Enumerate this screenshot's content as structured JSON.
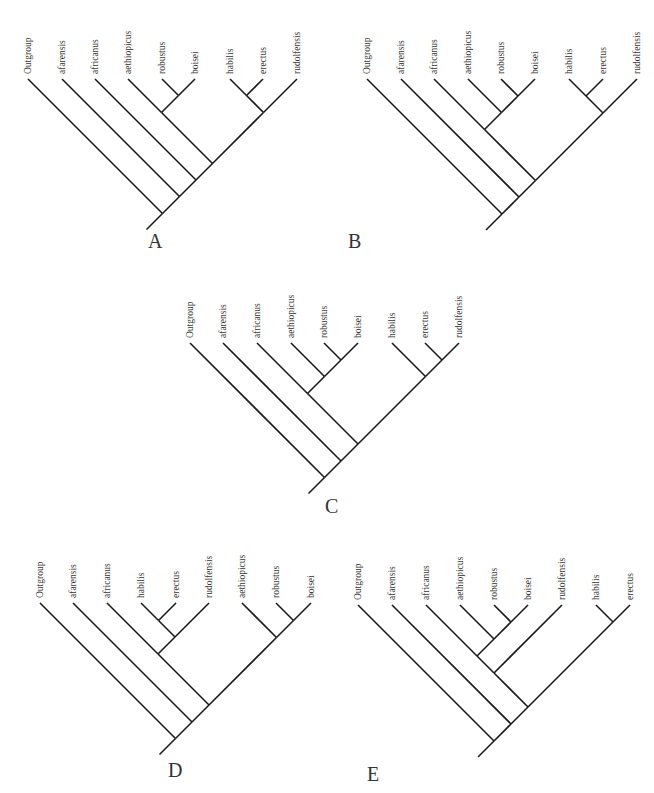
{
  "figure": {
    "taxa": [
      "Outgroup",
      "afarensis",
      "africanus",
      "aethiopicus",
      "robustus",
      "boisei",
      "habilis",
      "erectus",
      "rudolfensis"
    ]
  },
  "trees": [
    {
      "id": "A",
      "label": "A",
      "label_pos": [
        148,
        248
      ],
      "tip_y": 79,
      "root_extend": 16,
      "tips": [
        {
          "name": "Outgroup",
          "x": 28
        },
        {
          "name": "afarensis",
          "x": 62
        },
        {
          "name": "africanus",
          "x": 95
        },
        {
          "name": "aethiopicus",
          "x": 128
        },
        {
          "name": "robustus",
          "x": 162
        },
        {
          "name": "boisei",
          "x": 195
        },
        {
          "name": "habilis",
          "x": 230
        },
        {
          "name": "erectus",
          "x": 263
        },
        {
          "name": "rudolfensis",
          "x": 297
        }
      ],
      "newick": "(Outgroup,(afarensis,(africanus,((aethiopicus,(robustus,boisei)),((habilis,erectus),rudolfensis)))))",
      "structure": [
        "Outgroup",
        [
          "afarensis",
          [
            "africanus",
            [
              [
                "aethiopicus",
                [
                  "robustus",
                  "boisei"
                ]
              ],
              [
                [
                  "habilis",
                  "erectus"
                ],
                "rudolfensis"
              ]
            ]
          ]
        ]
      ]
    },
    {
      "id": "B",
      "label": "B",
      "label_pos": [
        348,
        248
      ],
      "tip_y": 79,
      "root_extend": 16,
      "tips": [
        {
          "name": "Outgroup",
          "x": 367
        },
        {
          "name": "afarensis",
          "x": 401
        },
        {
          "name": "africanus",
          "x": 434
        },
        {
          "name": "aethiopicus",
          "x": 468
        },
        {
          "name": "robustus",
          "x": 501
        },
        {
          "name": "boisei",
          "x": 535
        },
        {
          "name": "habilis",
          "x": 569
        },
        {
          "name": "erectus",
          "x": 603
        },
        {
          "name": "rudolfensis",
          "x": 637
        }
      ],
      "newick": "(Outgroup,(afarensis,((africanus,(aethiopicus,(robustus,boisei))),((habilis,erectus),rudolfensis))))",
      "structure": [
        "Outgroup",
        [
          "afarensis",
          [
            [
              "africanus",
              [
                "aethiopicus",
                [
                  "robustus",
                  "boisei"
                ]
              ]
            ],
            [
              [
                "habilis",
                "erectus"
              ],
              "rudolfensis"
            ]
          ]
        ]
      ]
    },
    {
      "id": "C",
      "label": "C",
      "label_pos": [
        325,
        513
      ],
      "tip_y": 343,
      "root_extend": 16,
      "tips": [
        {
          "name": "Outgroup",
          "x": 190
        },
        {
          "name": "afarensis",
          "x": 223
        },
        {
          "name": "africanus",
          "x": 257
        },
        {
          "name": "aethiopicus",
          "x": 291
        },
        {
          "name": "robustus",
          "x": 324
        },
        {
          "name": "boisei",
          "x": 358
        },
        {
          "name": "habilis",
          "x": 392
        },
        {
          "name": "erectus",
          "x": 425
        },
        {
          "name": "rudolfensis",
          "x": 459
        }
      ],
      "newick": "(Outgroup,(afarensis,((africanus,(aethiopicus,(robustus,boisei))),(habilis,(erectus,rudolfensis)))))",
      "structure": [
        "Outgroup",
        [
          "afarensis",
          [
            [
              "africanus",
              [
                "aethiopicus",
                [
                  "robustus",
                  "boisei"
                ]
              ]
            ],
            [
              "habilis",
              [
                "erectus",
                "rudolfensis"
              ]
            ]
          ]
        ]
      ]
    },
    {
      "id": "D",
      "label": "D",
      "label_pos": [
        168,
        777
      ],
      "tip_y": 603,
      "root_extend": 16,
      "tips": [
        {
          "name": "Outgroup",
          "x": 40
        },
        {
          "name": "afarensis",
          "x": 73
        },
        {
          "name": "africanus",
          "x": 107
        },
        {
          "name": "habilis",
          "x": 141
        },
        {
          "name": "erectus",
          "x": 176
        },
        {
          "name": "rudolfensis",
          "x": 209
        },
        {
          "name": "aethiopicus",
          "x": 242
        },
        {
          "name": "robustus",
          "x": 276
        },
        {
          "name": "boisei",
          "x": 311
        }
      ],
      "newick": "(Outgroup,(afarensis,((africanus,((habilis,erectus),rudolfensis)),(aethiopicus,(robustus,boisei)))))",
      "structure": [
        "Outgroup",
        [
          "afarensis",
          [
            [
              "africanus",
              [
                [
                  "habilis",
                  "erectus"
                ],
                "rudolfensis"
              ]
            ],
            [
              "aethiopicus",
              [
                "robustus",
                "boisei"
              ]
            ]
          ]
        ]
      ]
    },
    {
      "id": "E",
      "label": "E",
      "label_pos": [
        367,
        781
      ],
      "tip_y": 605,
      "root_extend": 16,
      "tips": [
        {
          "name": "Outgroup",
          "x": 358
        },
        {
          "name": "afarensis",
          "x": 392
        },
        {
          "name": "africanus",
          "x": 426
        },
        {
          "name": "aethiopicus",
          "x": 460
        },
        {
          "name": "robustus",
          "x": 494
        },
        {
          "name": "boisei",
          "x": 528
        },
        {
          "name": "rudolfensis",
          "x": 562
        },
        {
          "name": "habilis",
          "x": 596
        },
        {
          "name": "erectus",
          "x": 630
        }
      ],
      "newick": "(Outgroup,(afarensis,(((africanus,(aethiopicus,(robustus,boisei))),rudolfensis),(habilis,erectus))))",
      "structure": [
        "Outgroup",
        [
          "afarensis",
          [
            [
              [
                "africanus",
                [
                  "aethiopicus",
                  [
                    "robustus",
                    "boisei"
                  ]
                ]
              ],
              "rudolfensis"
            ],
            [
              "habilis",
              "erectus"
            ]
          ]
        ]
      ]
    }
  ]
}
